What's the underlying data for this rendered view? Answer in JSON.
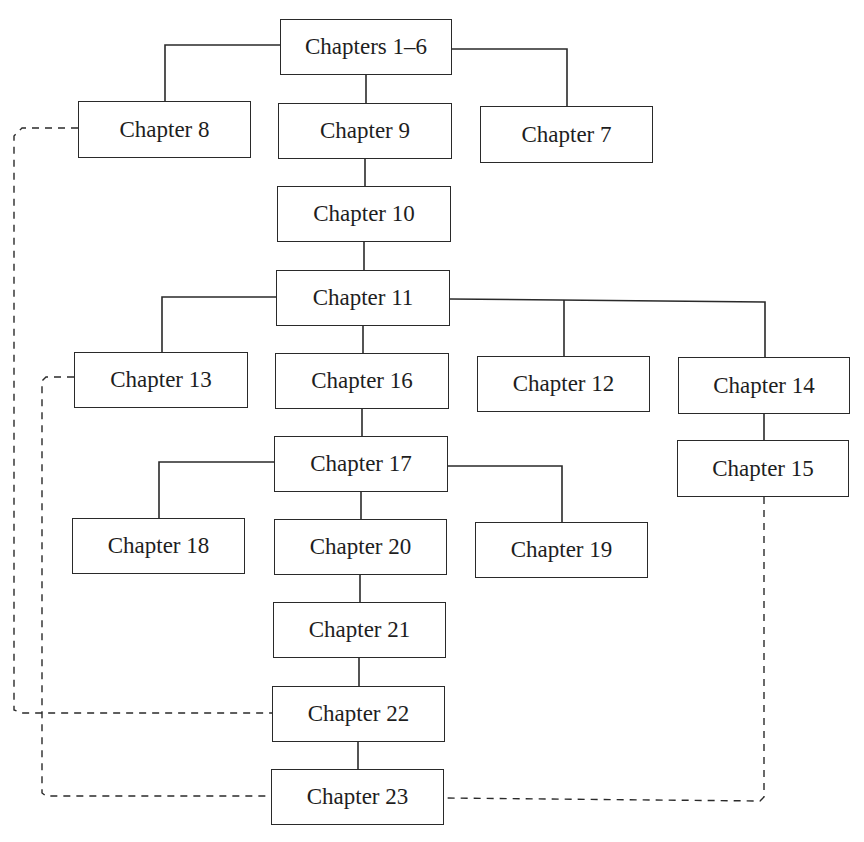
{
  "diagram": {
    "type": "chapter-dependency-tree",
    "colors": {
      "line": "#2a2a2a",
      "box_border": "#2a2a2a",
      "text": "#1e1e1e",
      "background": "#ffffff"
    },
    "nodes": [
      {
        "id": "ch1_6",
        "label": "Chapters 1–6",
        "x": 280,
        "y": 19,
        "w": 172,
        "h": 56
      },
      {
        "id": "ch8",
        "label": "Chapter 8",
        "x": 78,
        "y": 101,
        "w": 173,
        "h": 57
      },
      {
        "id": "ch9",
        "label": "Chapter 9",
        "x": 278,
        "y": 103,
        "w": 174,
        "h": 56
      },
      {
        "id": "ch7",
        "label": "Chapter 7",
        "x": 480,
        "y": 106,
        "w": 173,
        "h": 57
      },
      {
        "id": "ch10",
        "label": "Chapter 10",
        "x": 277,
        "y": 186,
        "w": 174,
        "h": 56
      },
      {
        "id": "ch11",
        "label": "Chapter 11",
        "x": 276,
        "y": 270,
        "w": 174,
        "h": 56
      },
      {
        "id": "ch13",
        "label": "Chapter 13",
        "x": 74,
        "y": 352,
        "w": 174,
        "h": 56
      },
      {
        "id": "ch16",
        "label": "Chapter 16",
        "x": 275,
        "y": 353,
        "w": 174,
        "h": 56
      },
      {
        "id": "ch12",
        "label": "Chapter 12",
        "x": 477,
        "y": 356,
        "w": 173,
        "h": 56
      },
      {
        "id": "ch14",
        "label": "Chapter 14",
        "x": 678,
        "y": 357,
        "w": 172,
        "h": 57
      },
      {
        "id": "ch17",
        "label": "Chapter 17",
        "x": 274,
        "y": 436,
        "w": 174,
        "h": 56
      },
      {
        "id": "ch15",
        "label": "Chapter 15",
        "x": 677,
        "y": 440,
        "w": 172,
        "h": 57
      },
      {
        "id": "ch18",
        "label": "Chapter 18",
        "x": 72,
        "y": 518,
        "w": 173,
        "h": 56
      },
      {
        "id": "ch20",
        "label": "Chapter 20",
        "x": 274,
        "y": 519,
        "w": 173,
        "h": 56
      },
      {
        "id": "ch19",
        "label": "Chapter 19",
        "x": 475,
        "y": 522,
        "w": 173,
        "h": 56
      },
      {
        "id": "ch21",
        "label": "Chapter 21",
        "x": 273,
        "y": 602,
        "w": 173,
        "h": 56
      },
      {
        "id": "ch22",
        "label": "Chapter 22",
        "x": 272,
        "y": 686,
        "w": 173,
        "h": 56
      },
      {
        "id": "ch23",
        "label": "Chapter 23",
        "x": 271,
        "y": 769,
        "w": 173,
        "h": 56
      }
    ],
    "solid_edges": [
      {
        "from": "ch1_6",
        "to": "ch8",
        "points": [
          [
            280,
            45
          ],
          [
            165,
            45
          ],
          [
            165,
            101
          ]
        ]
      },
      {
        "from": "ch1_6",
        "to": "ch9",
        "points": [
          [
            366,
            75
          ],
          [
            366,
            103
          ]
        ]
      },
      {
        "from": "ch1_6",
        "to": "ch7",
        "points": [
          [
            452,
            49
          ],
          [
            567,
            49
          ],
          [
            567,
            106
          ]
        ]
      },
      {
        "from": "ch9",
        "to": "ch10",
        "points": [
          [
            365,
            159
          ],
          [
            365,
            186
          ]
        ]
      },
      {
        "from": "ch10",
        "to": "ch11",
        "points": [
          [
            364,
            242
          ],
          [
            364,
            270
          ]
        ]
      },
      {
        "from": "ch11",
        "to": "ch13",
        "points": [
          [
            276,
            297
          ],
          [
            162,
            297
          ],
          [
            162,
            352
          ]
        ]
      },
      {
        "from": "ch11",
        "to": "ch16",
        "points": [
          [
            363,
            326
          ],
          [
            363,
            353
          ]
        ]
      },
      {
        "from": "ch11",
        "to": "ch12",
        "points": [
          [
            450,
            299
          ],
          [
            765,
            302
          ],
          [
            765,
            357
          ]
        ]
      },
      {
        "from": "ch11",
        "to": "ch12-drop",
        "points": [
          [
            564,
            300
          ],
          [
            564,
            356
          ]
        ]
      },
      {
        "from": "ch16",
        "to": "ch17",
        "points": [
          [
            362,
            409
          ],
          [
            362,
            436
          ]
        ]
      },
      {
        "from": "ch14",
        "to": "ch15",
        "points": [
          [
            764,
            414
          ],
          [
            764,
            440
          ]
        ]
      },
      {
        "from": "ch17",
        "to": "ch18",
        "points": [
          [
            274,
            462
          ],
          [
            159,
            462
          ],
          [
            159,
            518
          ]
        ]
      },
      {
        "from": "ch17",
        "to": "ch20",
        "points": [
          [
            361,
            492
          ],
          [
            361,
            519
          ]
        ]
      },
      {
        "from": "ch17",
        "to": "ch19",
        "points": [
          [
            448,
            466
          ],
          [
            562,
            466
          ],
          [
            562,
            522
          ]
        ]
      },
      {
        "from": "ch20",
        "to": "ch21",
        "points": [
          [
            360,
            575
          ],
          [
            360,
            602
          ]
        ]
      },
      {
        "from": "ch21",
        "to": "ch22",
        "points": [
          [
            359,
            658
          ],
          [
            359,
            686
          ]
        ]
      },
      {
        "from": "ch22",
        "to": "ch23",
        "points": [
          [
            358,
            742
          ],
          [
            358,
            769
          ]
        ]
      }
    ],
    "dashed_edges": [
      {
        "from": "ch8",
        "to": "ch22",
        "points": [
          [
            78,
            128
          ],
          [
            22,
            128
          ],
          [
            14,
            136
          ],
          [
            14,
            710
          ],
          [
            22,
            713
          ],
          [
            272,
            713
          ]
        ]
      },
      {
        "from": "ch13",
        "to": "ch23",
        "points": [
          [
            74,
            377
          ],
          [
            46,
            377
          ],
          [
            42,
            381
          ],
          [
            42,
            793
          ],
          [
            46,
            796
          ],
          [
            271,
            796
          ]
        ]
      },
      {
        "from": "ch15",
        "to": "ch23",
        "points": [
          [
            764,
            497
          ],
          [
            764,
            797
          ],
          [
            760,
            801
          ],
          [
            444,
            798
          ]
        ]
      }
    ]
  }
}
